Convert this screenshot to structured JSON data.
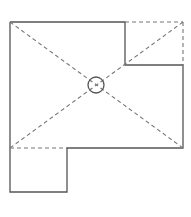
{
  "diagram": {
    "type": "roof-plan",
    "stroke_color": "#555555",
    "dash_color": "#777777",
    "background": "#ffffff",
    "outline_solid": [
      [
        10,
        22
      ],
      [
        125,
        22
      ],
      [
        125,
        65
      ],
      [
        183,
        65
      ],
      [
        183,
        148
      ],
      [
        67,
        148
      ],
      [
        67,
        192
      ],
      [
        10,
        192
      ],
      [
        10,
        22
      ]
    ],
    "dashed_segments": [
      [
        [
          125,
          22
        ],
        [
          183,
          22
        ]
      ],
      [
        [
          183,
          22
        ],
        [
          183,
          65
        ]
      ],
      [
        [
          10,
          148
        ],
        [
          67,
          148
        ]
      ],
      [
        [
          10,
          22
        ],
        [
          183,
          148
        ]
      ],
      [
        [
          183,
          22
        ],
        [
          10,
          148
        ]
      ]
    ],
    "center_marker": {
      "cx": 96,
      "cy": 85,
      "r": 8,
      "label": "drain-symbol"
    }
  }
}
